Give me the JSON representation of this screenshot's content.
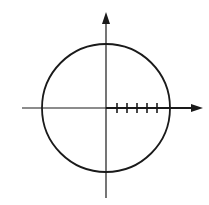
{
  "diagram": {
    "type": "unit-circle-with-axes",
    "colors": {
      "stroke": "#1a1a1a",
      "background": "#ffffff"
    },
    "circle": {
      "cx": 106,
      "cy": 108,
      "r": 64
    },
    "x_axis": {
      "x1": 22,
      "x2": 203,
      "y": 108,
      "arrow": "right"
    },
    "y_axis": {
      "x": 106,
      "y1": 12,
      "y2": 198,
      "arrow": "up"
    },
    "ticks_positive_x": [
      117,
      127,
      137,
      147,
      157
    ],
    "tick_count": 5
  }
}
